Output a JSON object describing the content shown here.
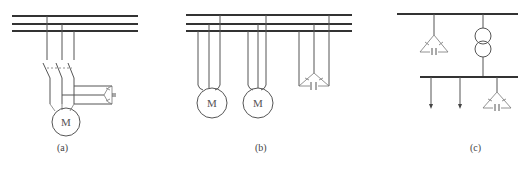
{
  "diagrams": [
    {
      "id": "a",
      "caption": "(a)",
      "motor_label": "M"
    },
    {
      "id": "b",
      "caption": "(b)",
      "motor_labels": [
        "M",
        "M"
      ]
    },
    {
      "id": "c",
      "caption": "(c)"
    }
  ],
  "colors": {
    "line": "#555555",
    "bus": "#333333",
    "background": "#ffffff"
  }
}
